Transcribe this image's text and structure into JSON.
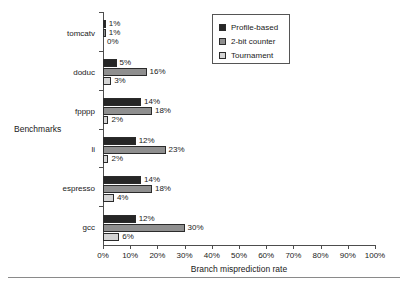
{
  "chart_data": {
    "type": "bar",
    "orientation": "horizontal",
    "title": "",
    "xlabel": "Branch misprediction rate",
    "ylabel": "Benchmarks",
    "xlim": [
      0,
      100
    ],
    "xtick_labels": [
      "0%",
      "10%",
      "20%",
      "30%",
      "40%",
      "50%",
      "60%",
      "70%",
      "80%",
      "90%",
      "100%"
    ],
    "xtick_values": [
      0,
      10,
      20,
      30,
      40,
      50,
      60,
      70,
      80,
      90,
      100
    ],
    "grid": false,
    "legend_position": "top-right",
    "categories": [
      "tomcatv",
      "doduc",
      "fpppp",
      "li",
      "espresso",
      "gcc"
    ],
    "series": [
      {
        "name": "Profile-based",
        "color": "#262626",
        "values": [
          1,
          5,
          14,
          12,
          14,
          12
        ],
        "labels": [
          "1%",
          "5%",
          "14%",
          "12%",
          "14%",
          "12%"
        ]
      },
      {
        "name": "2-bit counter",
        "color": "#8f8f8f",
        "values": [
          1,
          16,
          18,
          23,
          18,
          30
        ],
        "labels": [
          "1%",
          "16%",
          "18%",
          "23%",
          "18%",
          "30%"
        ]
      },
      {
        "name": "Tournament",
        "color": "#d4d4d4",
        "values": [
          0,
          3,
          2,
          2,
          4,
          6
        ],
        "labels": [
          "0%",
          "3%",
          "2%",
          "2%",
          "4%",
          "6%"
        ]
      }
    ]
  }
}
